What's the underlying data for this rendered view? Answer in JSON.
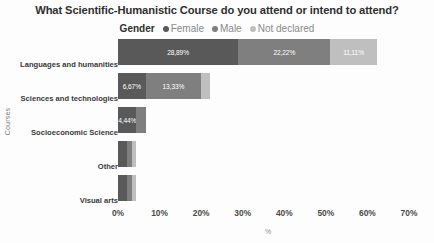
{
  "chart": {
    "title": "What Scientific-Humanistic Course do you attend or intend to attend?",
    "legend_title": "Gender"
  },
  "chart_data": {
    "type": "bar",
    "orientation": "horizontal",
    "stacked": true,
    "title": "What Scientific-Humanistic Course do you attend or intend to attend?",
    "xlabel": "%",
    "ylabel": "Courses",
    "xlim": [
      0,
      70
    ],
    "xticks": [
      "0%",
      "10%",
      "20%",
      "30%",
      "40%",
      "50%",
      "60%",
      "70%"
    ],
    "xtick_values": [
      0,
      10,
      20,
      30,
      40,
      50,
      60,
      70
    ],
    "grid": false,
    "legend_position": "top-center",
    "categories": [
      "Languages and humanities",
      "Sciences and technologies",
      "Socioeconomic Science",
      "Other",
      "Visual arts"
    ],
    "series": [
      {
        "name": "Female",
        "color": "#595959",
        "values": [
          28.89,
          6.67,
          4.44,
          2.22,
          2.22
        ],
        "labels": [
          "28,89%",
          "6,67%",
          "4,44%",
          "",
          ""
        ]
      },
      {
        "name": "Male",
        "color": "#7f7f7f",
        "values": [
          22.22,
          13.33,
          2.22,
          1.11,
          1.11
        ],
        "labels": [
          "22,22%",
          "13,33%",
          "",
          "",
          ""
        ]
      },
      {
        "name": "Not declared",
        "color": "#bfbfbf",
        "values": [
          11.11,
          2.22,
          0.0,
          1.11,
          1.11
        ],
        "labels": [
          "11,11%",
          "",
          "",
          "",
          ""
        ]
      }
    ]
  },
  "colors": {
    "female": "#595959",
    "male": "#7f7f7f",
    "not_declared": "#bfbfbf",
    "title_text": "#2f2f2f",
    "background": "#fdfdfd"
  }
}
